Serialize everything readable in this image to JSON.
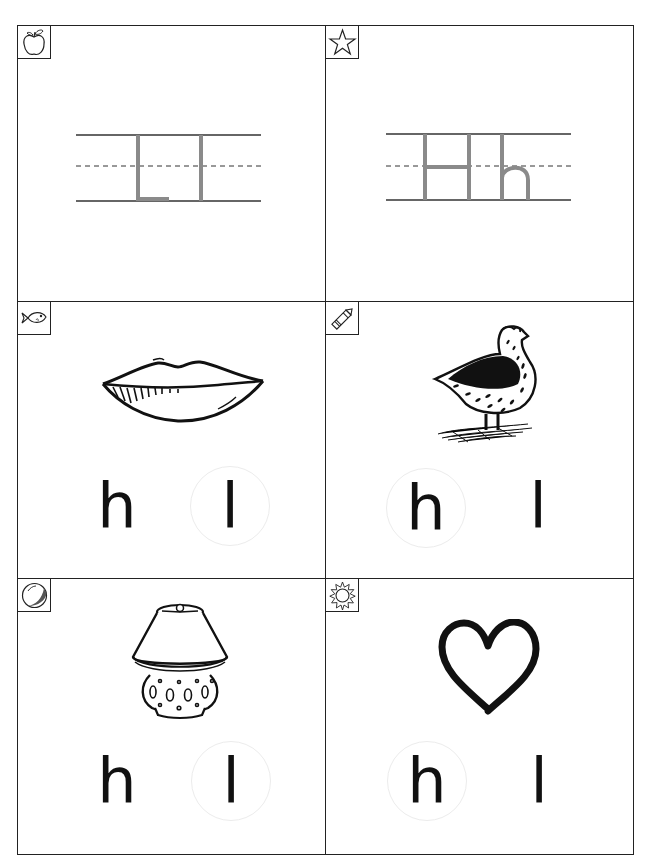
{
  "worksheet": {
    "colors": {
      "border": "#222222",
      "trace_letter": "#8a8a8a",
      "guide_line": "#333333",
      "circle": "#ececec",
      "text": "#111111"
    },
    "cards": [
      {
        "id": "trace-L",
        "corner_icon": "apple-icon",
        "type": "tracing",
        "letters": [
          "L",
          "l"
        ]
      },
      {
        "id": "trace-H",
        "corner_icon": "star-icon",
        "type": "tracing",
        "letters": [
          "H",
          "h"
        ]
      },
      {
        "id": "lips",
        "corner_icon": "fish-icon",
        "type": "choice",
        "picture": "lips-picture",
        "choices": [
          {
            "label": "h",
            "circled": false
          },
          {
            "label": "l",
            "circled": true
          }
        ]
      },
      {
        "id": "hen",
        "corner_icon": "crayon-icon",
        "type": "choice",
        "picture": "hen-picture",
        "choices": [
          {
            "label": "h",
            "circled": true
          },
          {
            "label": "l",
            "circled": false
          }
        ]
      },
      {
        "id": "lamp",
        "corner_icon": "ball-icon",
        "type": "choice",
        "picture": "lamp-picture",
        "choices": [
          {
            "label": "h",
            "circled": false
          },
          {
            "label": "l",
            "circled": true
          }
        ]
      },
      {
        "id": "heart",
        "corner_icon": "sun-icon",
        "type": "choice",
        "picture": "heart-picture",
        "choices": [
          {
            "label": "h",
            "circled": true
          },
          {
            "label": "l",
            "circled": false
          }
        ]
      }
    ]
  }
}
